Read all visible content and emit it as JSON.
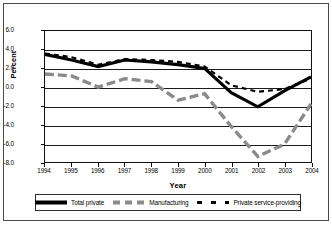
{
  "chart_data": {
    "type": "line",
    "title": "",
    "xlabel": "Year",
    "ylabel": "Percent",
    "x": [
      1994,
      1995,
      1996,
      1997,
      1998,
      1999,
      2000,
      2001,
      2002,
      2003,
      2004
    ],
    "xtick_labels": [
      "1994",
      "1995",
      "1996",
      "1997",
      "1998",
      "1999",
      "2000",
      "2001",
      "2002",
      "2003",
      "2004"
    ],
    "ytick_labels": [
      "6.0",
      "4.0",
      "2.0",
      "0.0",
      "-2.0",
      "-4.0",
      "-6.0",
      "-8.0"
    ],
    "ytick_values": [
      6.0,
      4.0,
      2.0,
      0.0,
      -2.0,
      -4.0,
      -6.0,
      -8.0
    ],
    "ylim": [
      -8.0,
      6.0
    ],
    "xlim": [
      1994,
      2004
    ],
    "grid": true,
    "legend_position": "bottom",
    "series": [
      {
        "name": "Total private",
        "style": "solid-thick-black",
        "color": "#000000",
        "values": [
          3.5,
          2.9,
          2.2,
          2.9,
          2.7,
          2.4,
          2.0,
          -0.6,
          -2.1,
          -0.4,
          1.1
        ]
      },
      {
        "name": "Manufacturing",
        "style": "dashed-thick-gray",
        "color": "#8a8a8a",
        "values": [
          1.4,
          1.2,
          0.0,
          0.9,
          0.6,
          -1.4,
          -0.7,
          -4.2,
          -7.4,
          -6.1,
          -1.8
        ]
      },
      {
        "name": "Private service-providing",
        "style": "dashed-black",
        "color": "#000000",
        "values": [
          3.6,
          3.2,
          2.4,
          3.0,
          2.9,
          2.7,
          2.2,
          0.2,
          -0.5,
          -0.2,
          0.9
        ]
      }
    ]
  },
  "legend": {
    "items": [
      {
        "label": "Total private"
      },
      {
        "label": "Manufacturing"
      },
      {
        "label": "Private service-providing"
      }
    ]
  }
}
